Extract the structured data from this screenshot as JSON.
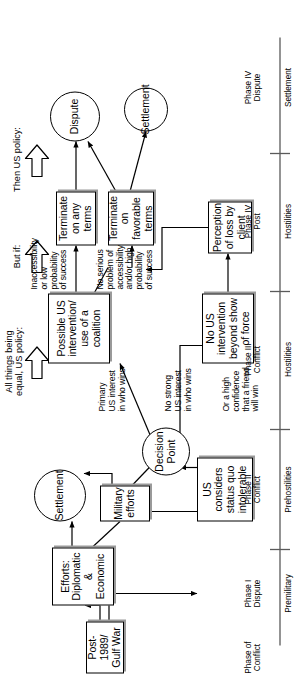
{
  "diagram": {
    "annotations": [
      {
        "id": "ann-all-things",
        "text": "All things being\nequal, US policy:"
      },
      {
        "id": "ann-but-if",
        "text": "But if:"
      },
      {
        "id": "ann-then",
        "text": "Then US policy:"
      }
    ],
    "nodes": [
      {
        "id": "node-post-1989",
        "label": "Post-1989/\nGulf War",
        "shape": "box"
      },
      {
        "id": "node-efforts",
        "label": "Efforts:\nDiplomatic\n& Economic",
        "shape": "box"
      },
      {
        "id": "node-military-efforts",
        "label": "Military\nefforts",
        "shape": "box"
      },
      {
        "id": "node-status-quo",
        "label": "US considers\nstatus quo\nintolerable",
        "shape": "box"
      },
      {
        "id": "node-settlement-early",
        "label": "Settlement",
        "shape": "circle"
      },
      {
        "id": "node-decision-point",
        "label": "Decision\nPoint",
        "shape": "circle"
      },
      {
        "id": "node-possible-intervention",
        "label": "Possible US\nintervention/\nuse of a\ncoalition",
        "shape": "box"
      },
      {
        "id": "node-no-intervention",
        "label": "No US\nintervention\nbeyond show\nof force",
        "shape": "box"
      },
      {
        "id": "node-perception-loss",
        "label": "Perception\nof loss\nby client",
        "shape": "box"
      },
      {
        "id": "node-terminate-any",
        "label": "Terminate\non any terms",
        "shape": "box"
      },
      {
        "id": "node-terminate-favorable",
        "label": "Terminate\non favorable\nterms",
        "shape": "box"
      },
      {
        "id": "node-dispute",
        "label": "Dispute",
        "shape": "circle"
      },
      {
        "id": "node-settlement-final",
        "label": "Settlement",
        "shape": "circle"
      }
    ],
    "edge_labels": [
      {
        "id": "edge-primary-interest",
        "text": "Primary\nUS interest\nin who wins"
      },
      {
        "id": "edge-no-strong-interest",
        "text": "No strong\nUS interest\nin who wins"
      },
      {
        "id": "edge-high-confidence",
        "text": "Or a high\nconfidence\nthat a friend\nwill win"
      },
      {
        "id": "edge-inaccessibility",
        "text": "Inaccessibility\nor low\nprobability\nof success"
      },
      {
        "id": "edge-no-serious-problem",
        "text": "No serious\nproblem of\naccessibility\nand/or high\nprobability\nof success"
      }
    ],
    "timeline": {
      "axis_label": "Phase of\nConflict",
      "phases": [
        {
          "id": "phase-1",
          "name": "Phase I\nDispute",
          "stage": "Premilitary"
        },
        {
          "id": "phase-2",
          "name": "Phase II\nConflict",
          "stage": "Prehostilities"
        },
        {
          "id": "phase-3",
          "name": "Phase III\nConflict",
          "stage": "Hostilities"
        },
        {
          "id": "phase-4-post",
          "name": "Phase IV\nPost",
          "stage": "Hostilities"
        },
        {
          "id": "phase-4-dispute",
          "name": "Phase IV\nDispute",
          "stage": "Settlement"
        }
      ]
    },
    "colors": {
      "stroke": "#000000",
      "background": "#ffffff",
      "shadow": "#9a9a9a"
    }
  }
}
